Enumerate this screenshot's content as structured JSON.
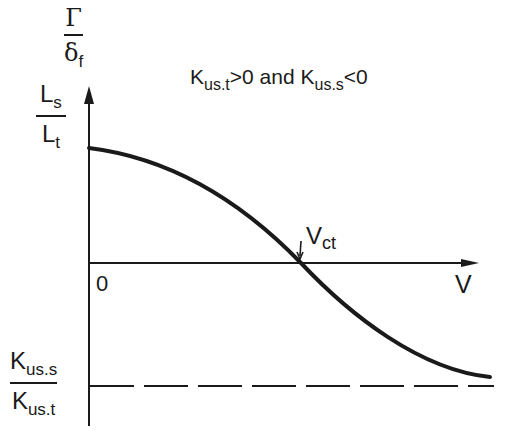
{
  "diagram": {
    "y_axis_label_top": {
      "numerator": "Γ",
      "denominator_main": "δ",
      "denominator_sub": "f"
    },
    "y_axis_label_second": {
      "numerator_main": "L",
      "numerator_sub": "s",
      "denominator_main": "L",
      "denominator_sub": "t"
    },
    "condition": {
      "k1_main": "K",
      "k1_sub": "us.t",
      "k1_rel": ">0",
      "conj": " and ",
      "k2_main": "K",
      "k2_sub": "us.s",
      "k2_rel": "<0"
    },
    "origin_label": "0",
    "x_axis_label": "V",
    "crossing_label": {
      "main": "V",
      "sub": "ct"
    },
    "asymptote_label": {
      "numerator_main": "K",
      "numerator_sub": "us.s",
      "denominator_main": "K",
      "denominator_sub": "us.t"
    },
    "colors": {
      "ink": "#1a1a1a",
      "background": "#ffffff"
    }
  }
}
